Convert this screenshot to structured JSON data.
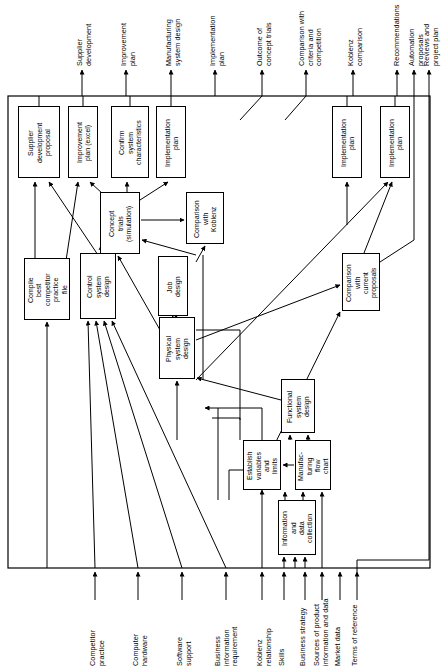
{
  "diagram": {
    "type": "flow-diagram",
    "frame": {
      "x": 8,
      "y": 96,
      "width": 422,
      "height": 472
    },
    "outputs_top": [
      {
        "id": "out-supplier-development",
        "label": "Supplier\ndevelopment",
        "x": 82
      },
      {
        "id": "out-improvement-plan",
        "label": "Improvement\nplan",
        "x": 126
      },
      {
        "id": "out-manufacturing-system-design",
        "label": "Manufacturing\nsystem design",
        "x": 171
      },
      {
        "id": "out-implementation-plan",
        "label": "Implementation\nplan",
        "x": 215
      },
      {
        "id": "out-outcome-concept-trials",
        "label": "Outcome of\nconcept trials",
        "x": 262
      },
      {
        "id": "out-comparison-criteria",
        "label": "Comparison with\ncriteria and\ncompetition",
        "x": 306
      },
      {
        "id": "out-koblenz-comparison",
        "label": "Koblenz\ncomparison",
        "x": 353
      },
      {
        "id": "out-recommendations",
        "label": "Recommendations",
        "x": 397
      },
      {
        "id": "out-automation-proposals",
        "label": "Automation\nproposals",
        "x": 414
      },
      {
        "id": "out-reviews-project-plan",
        "label": "Reviews and\nproject plan",
        "x": 429
      }
    ],
    "inputs_bottom": [
      {
        "id": "in-competitor-practice",
        "label": "Competitor\npractice",
        "x": 95
      },
      {
        "id": "in-computer-hardware",
        "label": "Computer\nhardware",
        "x": 138
      },
      {
        "id": "in-software-support",
        "label": "Software\nsupport",
        "x": 182
      },
      {
        "id": "in-business-information-requirement",
        "label": "Business\ninformation\nrequirement",
        "x": 226
      },
      {
        "id": "in-koblenz-relationship",
        "label": "Koblenz\nrelationship",
        "x": 262
      },
      {
        "id": "in-skills",
        "label": "Skills",
        "x": 284
      },
      {
        "id": "in-business-strategy",
        "label": "Business strategy",
        "x": 305
      },
      {
        "id": "in-sources-product-information",
        "label": "Sources of product\ninformation and data",
        "x": 322
      },
      {
        "id": "in-market-data",
        "label": "Market data",
        "x": 340
      },
      {
        "id": "in-terms-of-reference",
        "label": "Terms of reference",
        "x": 357
      }
    ],
    "nodes": [
      {
        "id": "supplier-development-proposal",
        "label": "Supplier\ndevelopment\nproposal",
        "x": 18,
        "y": 106,
        "w": 42,
        "h": 72
      },
      {
        "id": "improvement-plan-excel",
        "label": "Improvement\nplan (excel)",
        "x": 68,
        "y": 106,
        "w": 30,
        "h": 72
      },
      {
        "id": "confirm-system-characteristics",
        "label": "Confirm\nsystem\ncharacteristics",
        "x": 111,
        "y": 106,
        "w": 38,
        "h": 72
      },
      {
        "id": "implementation-plan-left",
        "label": "Implementation\nplan",
        "x": 156,
        "y": 106,
        "w": 30,
        "h": 72
      },
      {
        "id": "implementation-plan-mid",
        "label": "Implementation\nplan",
        "x": 332,
        "y": 106,
        "w": 30,
        "h": 72
      },
      {
        "id": "implementation-plan-right",
        "label": "Implementation\nplan",
        "x": 380,
        "y": 106,
        "w": 30,
        "h": 72
      },
      {
        "id": "concept-trials-simulation",
        "label": "Concept\ntrials\n(simulation)",
        "x": 100,
        "y": 192,
        "w": 40,
        "h": 62
      },
      {
        "id": "comparison-with-koblenz",
        "label": "Comparison\nwith\nKoblenz",
        "x": 186,
        "y": 192,
        "w": 38,
        "h": 52
      },
      {
        "id": "compile-best-competitor-practice-file",
        "label": "Compile\nbest\ncompetitor\npractice\nfile",
        "x": 24,
        "y": 258,
        "w": 46,
        "h": 62
      },
      {
        "id": "control-system-design",
        "label": "Control\nsystem\ndesign",
        "x": 80,
        "y": 253,
        "w": 36,
        "h": 66
      },
      {
        "id": "job-design",
        "label": "Job\ndesign",
        "x": 158,
        "y": 256,
        "w": 30,
        "h": 60
      },
      {
        "id": "comparison-with-current-proposals",
        "label": "Comparison\nwith\ncurrent\nproposals",
        "x": 342,
        "y": 253,
        "w": 38,
        "h": 58
      },
      {
        "id": "physical-system-design",
        "label": "Physical\nsystem\ndesign",
        "x": 159,
        "y": 317,
        "w": 36,
        "h": 62
      },
      {
        "id": "functional-system-design",
        "label": "Functional\nsystem\ndesign",
        "x": 281,
        "y": 379,
        "w": 34,
        "h": 54
      },
      {
        "id": "establish-variables-and-limits",
        "label": "Establish\nvariables\nand\nlimits",
        "x": 243,
        "y": 440,
        "w": 38,
        "h": 50
      },
      {
        "id": "manufacturing-flow-chart",
        "label": "Manufac-\nturing\nflow\nchart",
        "x": 295,
        "y": 440,
        "w": 36,
        "h": 50
      },
      {
        "id": "information-and-data-collection",
        "label": "Information\nand\ndata\ncollection",
        "x": 278,
        "y": 500,
        "w": 38,
        "h": 55
      }
    ],
    "colors": {
      "stroke": "#000000",
      "background": "#ffffff",
      "text": "#000000"
    }
  }
}
